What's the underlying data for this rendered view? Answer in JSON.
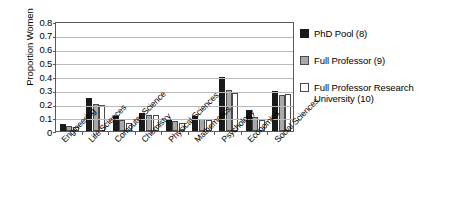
{
  "chart_data": {
    "type": "bar",
    "title": "",
    "xlabel": "",
    "ylabel": "Proportion Women",
    "ylim": [
      0,
      0.8
    ],
    "ytick_labels": [
      "0.8",
      "0.7",
      "0.6",
      "0.5",
      "0.4",
      "0.3",
      "0.2",
      "0.1",
      "0"
    ],
    "ytick_values": [
      0.8,
      0.7,
      0.6,
      0.5,
      0.4,
      0.3,
      0.2,
      0.1,
      0
    ],
    "grid": true,
    "legend_position": "right",
    "categories": [
      "Engineering",
      "Life Sciences",
      "Computer Science",
      "Chemistry",
      "Physical Sciences",
      "Mathematics",
      "Psychology",
      "Economics",
      "Social Sciences"
    ],
    "series": [
      {
        "name": "PhD Pool (8)",
        "color": "#1a1a1a",
        "values": [
          0.05,
          0.24,
          0.11,
          0.13,
          0.08,
          0.11,
          0.39,
          0.15,
          0.29
        ]
      },
      {
        "name": "Full Professor (9)",
        "color": "#a8a8a8",
        "values": [
          0.04,
          0.2,
          0.08,
          0.12,
          0.07,
          0.09,
          0.3,
          0.1,
          0.26
        ]
      },
      {
        "name": "Full Professor Research University (10)",
        "color": "#ffffff",
        "values": [
          0.03,
          0.19,
          0.06,
          0.12,
          0.06,
          0.08,
          0.28,
          0.08,
          0.27
        ]
      }
    ]
  },
  "legend": {
    "items": [
      {
        "label": "PhD Pool (8)"
      },
      {
        "label": "Full Professor (9)"
      },
      {
        "label": "Full Professor Research University (10)"
      }
    ]
  }
}
